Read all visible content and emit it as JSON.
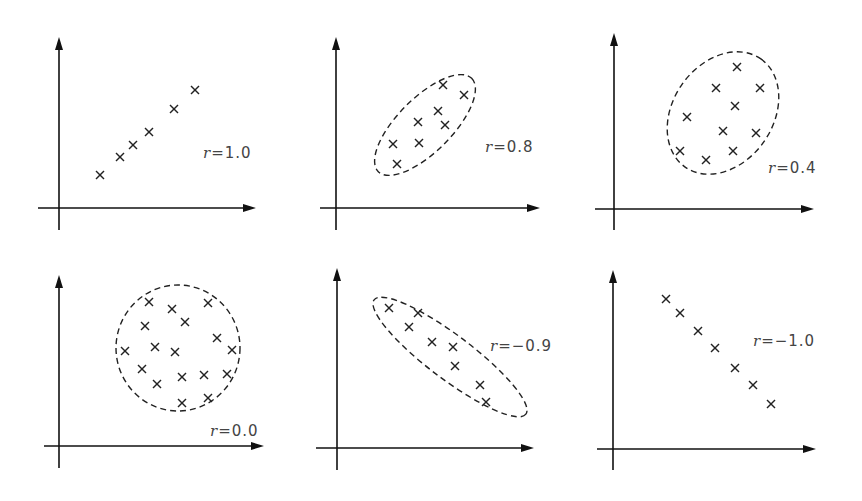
{
  "figure": {
    "panels": [
      {
        "label": "r=1.0",
        "r_value": 1.0,
        "envelope": false,
        "axes": {
          "ox": 59,
          "oy": 208,
          "x_end": 256,
          "x_start": 38,
          "y_top": 37,
          "y_bottom": 230
        },
        "label_pos": [
          203,
          158
        ],
        "points": [
          [
            100,
            175
          ],
          [
            120,
            157
          ],
          [
            133,
            145
          ],
          [
            149,
            132
          ],
          [
            174,
            109
          ],
          [
            195,
            90
          ]
        ]
      },
      {
        "label": "r=0.8",
        "r_value": 0.8,
        "envelope": true,
        "envelope_shape": {
          "cx": 425,
          "cy": 125,
          "rx": 66,
          "ry": 27,
          "rotate": -45
        },
        "axes": {
          "ox": 336,
          "oy": 208,
          "x_end": 540,
          "x_start": 320,
          "y_top": 37,
          "y_bottom": 230
        },
        "label_pos": [
          485,
          152
        ],
        "points": [
          [
            393,
            144
          ],
          [
            397,
            164
          ],
          [
            419,
            143
          ],
          [
            418,
            122
          ],
          [
            438,
            111
          ],
          [
            445,
            125
          ],
          [
            443,
            85
          ],
          [
            464,
            95
          ]
        ]
      },
      {
        "label": "r=0.4",
        "r_value": 0.4,
        "envelope": true,
        "envelope_shape": {
          "cx": 723,
          "cy": 113,
          "rx": 66,
          "ry": 50,
          "rotate": -55
        },
        "axes": {
          "ox": 614,
          "oy": 209,
          "x_end": 814,
          "x_start": 595,
          "y_top": 33,
          "y_bottom": 230
        },
        "label_pos": [
          768,
          173
        ],
        "points": [
          [
            737,
            67
          ],
          [
            716,
            88
          ],
          [
            760,
            88
          ],
          [
            735,
            106
          ],
          [
            687,
            117
          ],
          [
            723,
            131
          ],
          [
            756,
            133
          ],
          [
            680,
            151
          ],
          [
            706,
            160
          ],
          [
            733,
            151
          ]
        ]
      },
      {
        "label": "r=0.0",
        "r_value": 0.0,
        "envelope": true,
        "envelope_shape": {
          "cx": 178,
          "cy": 348,
          "rx": 62,
          "ry": 63,
          "rotate": 0
        },
        "axes": {
          "ox": 59,
          "oy": 446,
          "x_end": 264,
          "x_start": 44,
          "y_top": 275,
          "y_bottom": 468
        },
        "label_pos": [
          210,
          436
        ],
        "points": [
          [
            149,
            302
          ],
          [
            172,
            309
          ],
          [
            208,
            303
          ],
          [
            145,
            326
          ],
          [
            185,
            322
          ],
          [
            217,
            338
          ],
          [
            125,
            351
          ],
          [
            155,
            347
          ],
          [
            175,
            352
          ],
          [
            232,
            350
          ],
          [
            142,
            369
          ],
          [
            182,
            377
          ],
          [
            204,
            375
          ],
          [
            227,
            374
          ],
          [
            157,
            384
          ],
          [
            182,
            403
          ],
          [
            208,
            398
          ]
        ]
      },
      {
        "label": "r=−0.9",
        "r_value": -0.9,
        "envelope": true,
        "envelope_shape": {
          "cx": 450,
          "cy": 357,
          "rx": 95,
          "ry": 22,
          "rotate": 37
        },
        "axes": {
          "ox": 337,
          "oy": 448,
          "x_end": 534,
          "x_start": 316,
          "y_top": 268,
          "y_bottom": 470
        },
        "label_pos": [
          490,
          351
        ],
        "points": [
          [
            389,
            308
          ],
          [
            418,
            313
          ],
          [
            409,
            327
          ],
          [
            432,
            342
          ],
          [
            453,
            347
          ],
          [
            455,
            366
          ],
          [
            480,
            385
          ],
          [
            486,
            402
          ]
        ]
      },
      {
        "label": "r=−1.0",
        "r_value": -1.0,
        "envelope": false,
        "axes": {
          "ox": 613,
          "oy": 449,
          "x_end": 816,
          "x_start": 597,
          "y_top": 270,
          "y_bottom": 470
        },
        "label_pos": [
          753,
          346
        ],
        "points": [
          [
            666,
            299
          ],
          [
            680,
            313
          ],
          [
            698,
            331
          ],
          [
            715,
            348
          ],
          [
            735,
            368
          ],
          [
            753,
            385
          ],
          [
            771,
            404
          ]
        ]
      }
    ]
  },
  "chart_data": [
    {
      "type": "scatter",
      "title": "",
      "annotation": "r=1.0",
      "grid": false,
      "series": [
        {
          "name": "points",
          "x": [
            1,
            2,
            2.7,
            3.5,
            4.8,
            5.8
          ],
          "y": [
            1,
            2,
            2.7,
            3.5,
            4.8,
            5.8
          ]
        }
      ]
    },
    {
      "type": "scatter",
      "title": "",
      "annotation": "r=0.8",
      "grid": false,
      "envelope": "dashed ellipse",
      "series": [
        {
          "name": "points",
          "count": 8
        }
      ]
    },
    {
      "type": "scatter",
      "title": "",
      "annotation": "r=0.4",
      "grid": false,
      "envelope": "dashed ellipse",
      "series": [
        {
          "name": "points",
          "count": 10
        }
      ]
    },
    {
      "type": "scatter",
      "title": "",
      "annotation": "r=0.0",
      "grid": false,
      "envelope": "dashed circle",
      "series": [
        {
          "name": "points",
          "count": 17
        }
      ]
    },
    {
      "type": "scatter",
      "title": "",
      "annotation": "r=−0.9",
      "grid": false,
      "envelope": "dashed ellipse",
      "series": [
        {
          "name": "points",
          "count": 8
        }
      ]
    },
    {
      "type": "scatter",
      "title": "",
      "annotation": "r=−1.0",
      "grid": false,
      "series": [
        {
          "name": "points",
          "count": 7
        }
      ]
    }
  ]
}
